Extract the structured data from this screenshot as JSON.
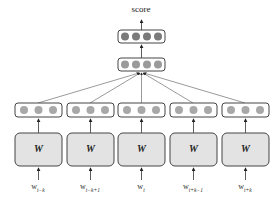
{
  "diagram": {
    "output_label": "score",
    "top_layers": [
      {
        "name": "output-layer",
        "nodes": 4,
        "color": "#7a7a7a"
      },
      {
        "name": "hidden-layer",
        "nodes": 4,
        "color": "#9a9a9a"
      }
    ],
    "columns": [
      {
        "weight_label": "W",
        "input_label": "w",
        "input_sub": "t−k",
        "nodes": 3
      },
      {
        "weight_label": "W",
        "input_label": "w",
        "input_sub": "t−k+1",
        "nodes": 3
      },
      {
        "weight_label": "W",
        "input_label": "w",
        "input_sub": "t",
        "nodes": 3
      },
      {
        "weight_label": "W",
        "input_label": "w",
        "input_sub": "t+k−1",
        "nodes": 3
      },
      {
        "weight_label": "W",
        "input_label": "w",
        "input_sub": "t+k",
        "nodes": 3
      }
    ],
    "colors": {
      "box_fill": "#e3e3e3",
      "stroke": "#444444",
      "node": "#a8a8a8"
    }
  }
}
